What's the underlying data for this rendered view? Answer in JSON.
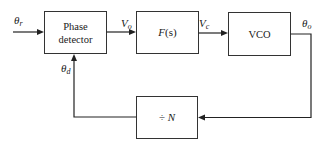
{
  "diagram": {
    "type": "block-diagram",
    "blocks": [
      {
        "id": "phase_detector",
        "line1": "Phase",
        "line2": "detector"
      },
      {
        "id": "loop_filter",
        "label": "F(s)",
        "label_main": "F",
        "label_arg": "(s)"
      },
      {
        "id": "vco",
        "label": "VCO"
      },
      {
        "id": "divider",
        "label": "÷ N",
        "label_op": "÷",
        "label_var": "N"
      }
    ],
    "signals": {
      "input": {
        "symbol": "θ",
        "sub": "r"
      },
      "pd_output": {
        "symbol": "V",
        "sub": "o"
      },
      "filter_output": {
        "symbol": "V",
        "sub": "c"
      },
      "vco_output": {
        "symbol": "θ",
        "sub": "o"
      },
      "feedback": {
        "symbol": "θ",
        "sub": "d"
      }
    },
    "colors": {
      "line": "#222222",
      "box_border": "#333333",
      "text": "#1a1a1a",
      "background": "#ffffff"
    }
  }
}
